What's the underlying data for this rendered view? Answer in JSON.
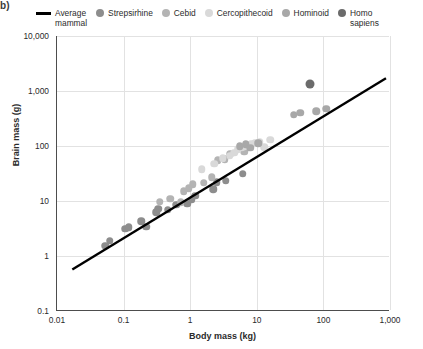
{
  "corner_label": "b)",
  "legend": {
    "items": [
      {
        "name": "average-mammal",
        "label": "Average\nmammal",
        "type": "line",
        "color": "#000000"
      },
      {
        "name": "strepsirhine",
        "label": "Strepsirhine",
        "type": "dot",
        "color": "#8d8d8d"
      },
      {
        "name": "cebid",
        "label": "Cebid",
        "type": "dot",
        "color": "#b4b4b4"
      },
      {
        "name": "cercopithecoid",
        "label": "Cercopithecoid",
        "type": "dot",
        "color": "#d9d9d9"
      },
      {
        "name": "hominoid",
        "label": "Hominoid",
        "type": "dot",
        "color": "#a8a8a8"
      },
      {
        "name": "homo-sapiens",
        "label": "Homo\nsapiens",
        "type": "dot",
        "color": "#6b6b6b"
      }
    ]
  },
  "chart_data": {
    "type": "scatter",
    "title": "",
    "xlabel": "Body mass (kg)",
    "ylabel": "Brain mass (g)",
    "xscale": "log",
    "yscale": "log",
    "xlim": [
      0.01,
      1000
    ],
    "ylim": [
      0.1,
      10000
    ],
    "xticks": [
      "0.01",
      "0.1",
      "1",
      "10",
      "100",
      "1,000"
    ],
    "xtick_values": [
      0.01,
      0.1,
      1,
      10,
      100,
      1000
    ],
    "yticks": [
      "0.1",
      "1",
      "10",
      "100",
      "1,000",
      "10,000"
    ],
    "ytick_values": [
      0.1,
      1,
      10,
      100,
      1000,
      10000
    ],
    "grid": true,
    "legend_position": "top",
    "trendline": {
      "name": "Average mammal",
      "color": "#000000",
      "x0": 0.017,
      "y0": 0.55,
      "x1": 900,
      "y1": 1700
    },
    "series": [
      {
        "name": "Strepsirhine",
        "color": "#8d8d8d",
        "points": [
          [
            0.053,
            1.55
          ],
          [
            0.062,
            1.9
          ],
          [
            0.105,
            3.1
          ],
          [
            0.12,
            3.3
          ],
          [
            0.185,
            4.3
          ],
          [
            0.22,
            3.4
          ],
          [
            0.31,
            6.2
          ],
          [
            0.33,
            7.3
          ],
          [
            0.46,
            7.0
          ],
          [
            0.62,
            8.6
          ],
          [
            0.9,
            9.0
          ],
          [
            1.05,
            10.5
          ],
          [
            1.2,
            12.5
          ],
          [
            2.2,
            16.5
          ],
          [
            2.5,
            22.0
          ],
          [
            3.4,
            23.5
          ],
          [
            6.2,
            31.0
          ]
        ]
      },
      {
        "name": "Cebid",
        "color": "#b4b4b4",
        "points": [
          [
            0.35,
            9.6
          ],
          [
            0.5,
            11.0
          ],
          [
            0.72,
            9.5
          ],
          [
            0.8,
            15.0
          ],
          [
            0.95,
            17.0
          ],
          [
            1.1,
            20.0
          ],
          [
            1.6,
            21.5
          ],
          [
            2.1,
            27.0
          ],
          [
            2.6,
            55.0
          ],
          [
            3.3,
            58.0
          ],
          [
            4.0,
            72.0
          ],
          [
            6.5,
            78.0
          ],
          [
            7.2,
            95.0
          ]
        ]
      },
      {
        "name": "Cercopithecoid",
        "color": "#d9d9d9",
        "points": [
          [
            1.5,
            38.0
          ],
          [
            2.3,
            48.0
          ],
          [
            3.1,
            60.0
          ],
          [
            3.9,
            66.0
          ],
          [
            4.6,
            76.0
          ],
          [
            5.2,
            88.0
          ],
          [
            5.9,
            95.0
          ],
          [
            6.6,
            100.0
          ],
          [
            7.4,
            105.0
          ],
          [
            8.2,
            110.0
          ],
          [
            9.5,
            115.0
          ],
          [
            11.0,
            120.0
          ],
          [
            13.0,
            95.0
          ],
          [
            16.0,
            130.0
          ]
        ]
      },
      {
        "name": "Hominoid",
        "color": "#a8a8a8",
        "points": [
          [
            5.5,
            100.0
          ],
          [
            6.8,
            108.0
          ],
          [
            8.0,
            92.0
          ],
          [
            10.5,
            112.0
          ],
          [
            36.0,
            370.0
          ],
          [
            45.0,
            400.0
          ],
          [
            78.0,
            430.0
          ],
          [
            110.0,
            480.0
          ]
        ]
      },
      {
        "name": "Homo sapiens",
        "color": "#6b6b6b",
        "points": [
          [
            62.0,
            1320.0
          ]
        ]
      }
    ]
  }
}
